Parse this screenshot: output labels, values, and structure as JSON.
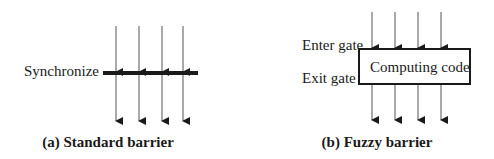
{
  "diagram": {
    "panel_a": {
      "label": "Synchronize",
      "caption": "(a) Standard barrier",
      "arrow_count": 4
    },
    "panel_b": {
      "enter_label": "Enter gate",
      "exit_label": "Exit gate",
      "box_text": "Computing code",
      "caption": "(b) Fuzzy barrier",
      "arrow_count": 4
    },
    "colors": {
      "stroke": "#1a1a1a",
      "line": "#555555",
      "background": "#ffffff"
    }
  }
}
